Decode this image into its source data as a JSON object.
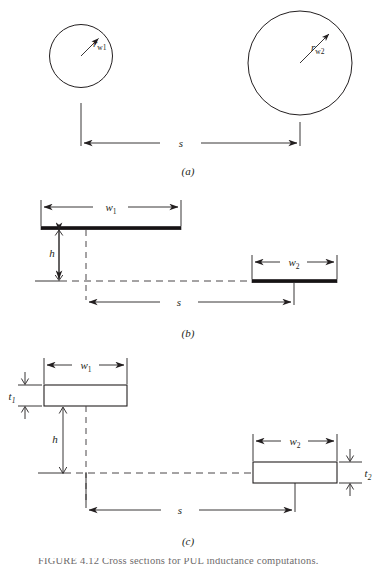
{
  "figure": {
    "title_caption": "FIGURE 4.12  Cross sections for PUL inductance computations.",
    "panels": [
      {
        "id": "a",
        "label": "(a)",
        "description": "two parallel circular wires",
        "labels": {
          "radius_1": "r",
          "radius_1_sub": "w1",
          "radius_2": "r",
          "radius_2_sub": "w2",
          "separation": "s"
        }
      },
      {
        "id": "b",
        "label": "(b)",
        "description": "two zero-thickness strips offset in height",
        "labels": {
          "width_1": "w",
          "width_1_sub": "1",
          "width_2": "w",
          "width_2_sub": "2",
          "height": "h",
          "separation": "s"
        }
      },
      {
        "id": "c",
        "label": "(c)",
        "description": "two rectangular bars with finite thickness",
        "labels": {
          "width_1": "w",
          "width_1_sub": "1",
          "width_2": "w",
          "width_2_sub": "2",
          "thickness_1": "t",
          "thickness_1_sub": "1",
          "thickness_2": "t",
          "thickness_2_sub": "2",
          "height": "h",
          "separation": "s"
        }
      }
    ],
    "colors": {
      "line": "#231f20",
      "dashed": "#4a4648",
      "conductor_fill": "#161314",
      "background": "#ffffff"
    }
  }
}
